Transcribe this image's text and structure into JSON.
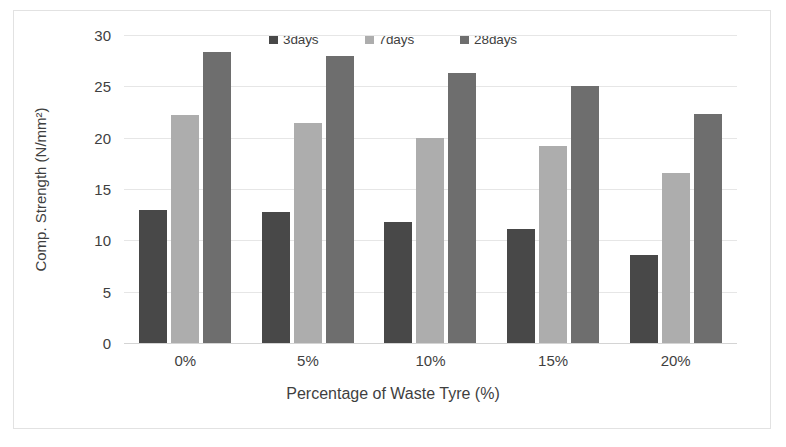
{
  "chart_data": {
    "type": "bar",
    "title": "",
    "xlabel": "Percentage of Waste Tyre (%)",
    "ylabel": "Comp. Strength (N/mm²)",
    "categories": [
      "0%",
      "5%",
      "10%",
      "15%",
      "20%"
    ],
    "yticks": [
      "0",
      "5",
      "10",
      "15",
      "20",
      "25",
      "30"
    ],
    "ylim": [
      0,
      30
    ],
    "grid": true,
    "legend_position": "top-center",
    "series": [
      {
        "name": "3days",
        "color": "#484848",
        "values": [
          13.0,
          12.8,
          11.8,
          11.1,
          8.6
        ]
      },
      {
        "name": "7days",
        "color": "#adadad",
        "values": [
          22.2,
          21.4,
          20.0,
          19.2,
          16.6
        ]
      },
      {
        "name": "28days",
        "color": "#6e6e6e",
        "values": [
          28.3,
          28.0,
          26.3,
          25.0,
          22.3
        ]
      }
    ]
  }
}
